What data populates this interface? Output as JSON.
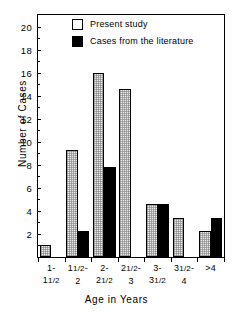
{
  "chart_data": {
    "type": "bar",
    "title": "",
    "xlabel": "Age in Years",
    "ylabel": "Number of Cases",
    "ylim": [
      0,
      21
    ],
    "yticks": [
      2,
      4,
      6,
      8,
      10,
      12,
      14,
      16,
      18,
      20
    ],
    "grid": false,
    "legend_position": "top-center",
    "categories": [
      "1-\n11/2",
      "11/2-\n2",
      "2-\n21/2",
      "21/2-\n3",
      "3-\n31/2",
      "31/2-\n4",
      ">4"
    ],
    "category_labels": [
      {
        "line1": "1-",
        "line2": "11/2"
      },
      {
        "line1": "11/2-",
        "line2": "2"
      },
      {
        "line1": "2-",
        "line2": "21/2"
      },
      {
        "line1": "21/2-",
        "line2": "3"
      },
      {
        "line1": "3-",
        "line2": "31/2"
      },
      {
        "line1": "31/2-",
        "line2": "4"
      },
      {
        "line1": ">4",
        "line2": ""
      }
    ],
    "series": [
      {
        "name": "Present study",
        "color": "#e9e9e9",
        "values": [
          1.0,
          9.3,
          16.0,
          14.6,
          4.6,
          3.4,
          2.3
        ]
      },
      {
        "name": "Cases from the literature",
        "color": "#000000",
        "values": [
          0,
          2.3,
          7.8,
          0,
          4.6,
          0,
          3.4
        ]
      }
    ]
  },
  "legend": {
    "items": [
      {
        "label": "Present study",
        "style": "open"
      },
      {
        "label": "Cases from the literature",
        "style": "filled"
      }
    ]
  },
  "axes": {
    "y_title": "Number of Cases",
    "x_title": "Age in Years"
  }
}
